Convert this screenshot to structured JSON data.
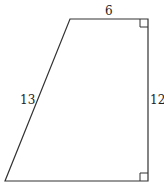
{
  "diagram": {
    "shape": "right trapezoid",
    "vertices": [
      [
        70,
        19
      ],
      [
        148,
        19
      ],
      [
        148,
        181
      ],
      [
        5,
        181
      ]
    ],
    "stroke_color": "#333333",
    "labels": {
      "top": "6",
      "left": "13",
      "right": "12"
    },
    "right_angles": [
      "top-right",
      "bottom-right"
    ]
  }
}
